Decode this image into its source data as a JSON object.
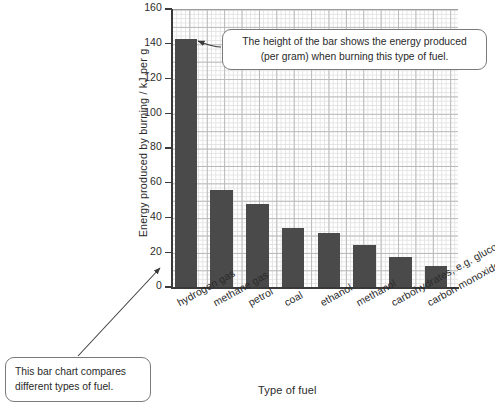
{
  "chart_data": {
    "type": "bar",
    "title": "",
    "xlabel": "Type of fuel",
    "ylabel": "Energy produced by burning / kJ per g",
    "categories": [
      "hydrogen gas",
      "methane gas",
      "petrol",
      "coal",
      "ethanol",
      "methanol",
      "carbohydrates, e.g. glucose",
      "carbon monoxide gas"
    ],
    "values": [
      143,
      56,
      48,
      34,
      31,
      24,
      17,
      12
    ],
    "ylim": [
      0,
      160
    ],
    "yticks": [
      0,
      20,
      40,
      60,
      80,
      100,
      120,
      140,
      160
    ],
    "ytick_labels": [
      "0",
      "20",
      "40",
      "60",
      "80",
      "100",
      "120",
      "140",
      "160"
    ],
    "grid": true,
    "grid_minor": true,
    "legend": false,
    "bar_color": "#4a4a4a",
    "grid_color_major": "#b9b9b9",
    "grid_color_minor": "#e2e2e2",
    "axis_color": "#3a3a3a",
    "annotations": [
      {
        "name": "bar-height-callout",
        "lines": [
          "The height of the bar shows the energy produced",
          "(per gram) when burning this type of fuel."
        ],
        "points_to": "hydrogen gas bar"
      },
      {
        "name": "chart-purpose-callout",
        "lines": [
          "This bar chart compares",
          "different types of fuel."
        ],
        "points_to": "chart"
      }
    ]
  }
}
